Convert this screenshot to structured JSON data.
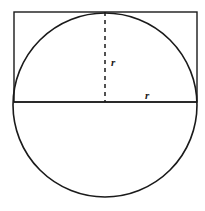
{
  "figure": {
    "canvas": {
      "width": 205,
      "height": 211,
      "background": "#ffffff"
    },
    "colors": {
      "stroke": "#1a1a1a",
      "dashed_stroke": "#1a1a1a",
      "label": "#1a1a1a",
      "fill": "none"
    },
    "circle": {
      "name": "circle",
      "center_x": 105,
      "center_y": 105,
      "radius": 92,
      "stroke_width": 1.6
    },
    "rectangle": {
      "name": "rectangle",
      "x": 14,
      "y": 12,
      "width": 183,
      "height": 90,
      "stroke_width": 1.4
    },
    "vertical_radius": {
      "name": "vertical-radius",
      "x": 105,
      "y1": 12,
      "y2": 102,
      "dash_pattern": "4 4",
      "stroke_width": 1.4,
      "label": "r",
      "label_x": 111,
      "label_y": 66
    },
    "horizontal_radius": {
      "name": "horizontal-radius",
      "x1": 14,
      "x2": 197,
      "y": 102,
      "stroke_width": 1.6,
      "label": "r",
      "label_x": 145,
      "label_y": 99
    }
  }
}
